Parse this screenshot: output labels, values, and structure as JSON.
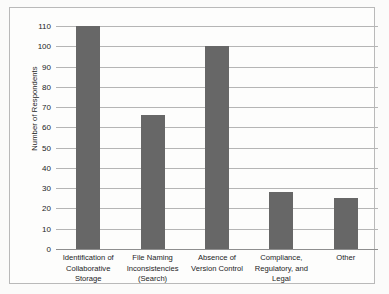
{
  "figure": {
    "background_color": "#fbfbfa",
    "border_color": "#b9b9b9",
    "bar_color": "#676767",
    "gridline_color": "#b5b5b5"
  },
  "chart_data": {
    "type": "bar",
    "title": "",
    "subtitle": "",
    "xlabel": "",
    "ylabel": "Number of Respondents",
    "ylim": [
      0,
      110
    ],
    "yticks": [
      0,
      10,
      20,
      30,
      40,
      50,
      60,
      70,
      80,
      90,
      100,
      110
    ],
    "ytick_labels": [
      "0",
      "10",
      "20",
      "30",
      "40",
      "50",
      "60",
      "70",
      "80",
      "90",
      "100",
      "110"
    ],
    "grid": true,
    "legend": null,
    "orientation": "vertical",
    "categories": [
      "Identification of Collaborative Storage",
      "File Naming Inconsistencies (Search)",
      "Absence of Version Control",
      "Compliance, Regulatory, and Legal",
      "Other"
    ],
    "category_label_lines": [
      [
        "Identification of",
        "Collaborative",
        "Storage"
      ],
      [
        "File Naming",
        "Inconsistencies",
        "(Search)"
      ],
      [
        "Absence of",
        "Version Control"
      ],
      [
        "Compliance,",
        "Regulatory, and",
        "Legal"
      ],
      [
        "Other"
      ]
    ],
    "values": [
      110,
      66,
      100,
      28,
      25
    ],
    "annotations": []
  }
}
